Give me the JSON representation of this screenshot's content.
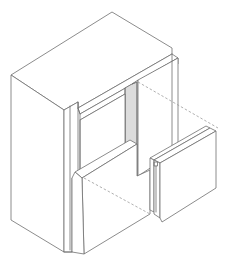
{
  "diagram": {
    "type": "isometric-line-drawing",
    "colors": {
      "line": "#6e6e6e",
      "shade": "#dcdcdc",
      "dashed": "#9a9a9a",
      "background": "#ffffff"
    },
    "parts": [
      {
        "id": "wall-block",
        "label": ""
      },
      {
        "id": "header-beam",
        "label": ""
      },
      {
        "id": "opening-jamb",
        "label": ""
      },
      {
        "id": "sill-block",
        "label": ""
      },
      {
        "id": "detached-panel",
        "label": ""
      },
      {
        "id": "projection-lines",
        "label": ""
      }
    ]
  }
}
